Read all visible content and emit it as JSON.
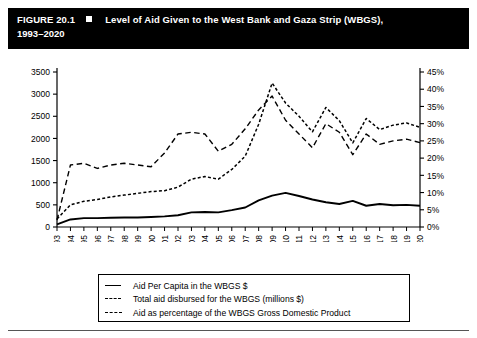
{
  "figure": {
    "number": "FIGURE 20.1",
    "marker_icon": "black-square-icon",
    "title_line1": "Level of Aid Given to the West Bank and Gaza Strip (WBGS),",
    "title_line2": "1993–2020"
  },
  "legend": {
    "items": [
      {
        "key": "solid",
        "label": "Aid Per Capita in the WBGS $"
      },
      {
        "key": "dotted",
        "label": "Total aid disbursed for the WBGS (millions $)"
      },
      {
        "key": "dashed",
        "label": "Aid as percentage of the WBGS Gross Domestic Product"
      }
    ]
  },
  "chart_data": {
    "type": "line",
    "title": "Level of Aid Given to the West Bank and Gaza Strip (WBGS), 1993–2020",
    "xlabel": "",
    "ylabel": "",
    "grid": false,
    "legend_position": "bottom",
    "categories": [
      "1993",
      "1994",
      "1995",
      "1996",
      "1997",
      "1998",
      "1999",
      "2000",
      "2001",
      "2002",
      "2003",
      "2004",
      "2005",
      "2006",
      "2007",
      "2008",
      "2009",
      "2010",
      "2011",
      "2012",
      "2013",
      "2014",
      "2015",
      "2016",
      "2017",
      "2018",
      "2019",
      "2020"
    ],
    "left_axis": {
      "label": "",
      "ylim": [
        0,
        3500
      ],
      "ticks": [
        0,
        500,
        1000,
        1500,
        2000,
        2500,
        3000,
        3500
      ],
      "ticklabels": [
        "0",
        "500",
        "1000",
        "1500",
        "2000",
        "2500",
        "3000",
        "3500"
      ]
    },
    "right_axis": {
      "label": "",
      "ylim": [
        0,
        45
      ],
      "ticks": [
        0,
        5,
        10,
        15,
        20,
        25,
        30,
        35,
        40,
        45
      ],
      "ticklabels": [
        "0%",
        "5%",
        "10%",
        "15%",
        "20%",
        "25%",
        "30%",
        "35%",
        "40%",
        "45%"
      ]
    },
    "series": [
      {
        "name": "Aid Per Capita in the WBGS $",
        "axis": "left",
        "style": "solid",
        "values": [
          60,
          170,
          200,
          200,
          210,
          215,
          215,
          225,
          240,
          265,
          330,
          340,
          330,
          380,
          440,
          600,
          710,
          770,
          700,
          620,
          560,
          520,
          590,
          480,
          520,
          490,
          500,
          480
        ]
      },
      {
        "name": "Total aid disbursed for the WBGS (millions $)",
        "axis": "left",
        "style": "dotted",
        "values": [
          180,
          500,
          580,
          620,
          680,
          720,
          760,
          800,
          820,
          900,
          1080,
          1140,
          1080,
          1300,
          1600,
          2320,
          3250,
          2800,
          2500,
          2150,
          2700,
          2400,
          1900,
          2450,
          2200,
          2300,
          2350,
          2250
        ]
      },
      {
        "name": "Aid as percentage of the WBGS Gross Domestic Product",
        "axis": "right",
        "style": "dashed",
        "values": [
          2,
          18,
          18.5,
          17,
          18,
          18.5,
          18,
          17.5,
          21.5,
          27,
          27.5,
          27,
          22,
          24,
          28.5,
          34,
          38,
          31,
          27,
          23,
          30,
          27.5,
          21,
          27,
          24,
          25,
          25.5,
          24.5
        ]
      }
    ]
  }
}
